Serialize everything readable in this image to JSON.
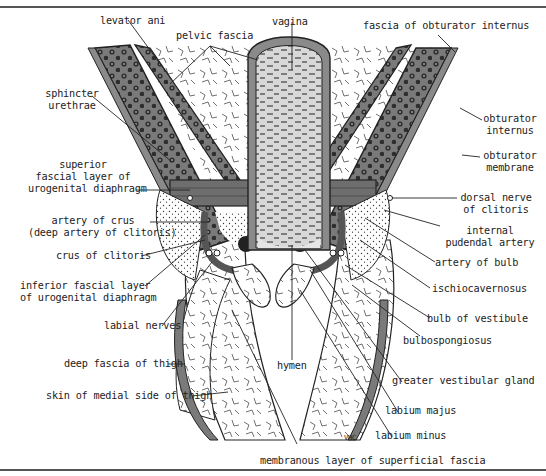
{
  "figure": {
    "type": "anatomical cross-section",
    "signature": "VHC",
    "colors": {
      "muscle_fill": "#7a7a7a",
      "muscle_dark": "#3a3a3a",
      "fascia_band": "#8a8a8a",
      "vagina_fill": "#d6d6d6",
      "background": "#ffffff",
      "line": "#222222"
    }
  },
  "labels": {
    "levator_ani": "levator ani",
    "pelvic_fascia": "pelvic fascia",
    "vagina": "vagina",
    "fascia_obturator_internus": "fascia of obturator internus",
    "sphincter_urethrae_1": "sphincter",
    "sphincter_urethrae_2": "urethrae",
    "obturator_internus_1": "obturator",
    "obturator_internus_2": "internus",
    "obturator_membrane_1": "obturator",
    "obturator_membrane_2": "membrane",
    "superior_fascial_1": "superior",
    "superior_fascial_2": "fascial layer of",
    "superior_fascial_3": "urogenital diaphragm",
    "dorsal_nerve_1": "dorsal nerve",
    "dorsal_nerve_2": "of clitoris",
    "artery_crus_1": "artery of crus",
    "artery_crus_2": "(deep artery of clitoris)",
    "internal_pudendal_1": "internal",
    "internal_pudendal_2": "pudendal artery",
    "crus_clitoris": "crus of clitoris",
    "artery_bulb": "artery of bulb",
    "inferior_fascial_1": "inferior fascial layer",
    "inferior_fascial_2": "of urogenital diaphragm",
    "ischiocavernosus": "ischiocavernosus",
    "labial_nerves": "labial nerves",
    "bulb_vestibule": "bulb of vestibule",
    "bulbospongiosus": "bulbospongiosus",
    "hymen": "hymen",
    "deep_fascia_thigh": "deep fascia of thigh",
    "greater_vestibular_gland": "greater vestibular gland",
    "skin_medial_thigh": "skin of medial side of thigh",
    "labium_majus": "labium majus",
    "labium_minus": "labium minus",
    "membranous_layer": "membranous layer of superficial fascia",
    "signature": "VHC"
  }
}
